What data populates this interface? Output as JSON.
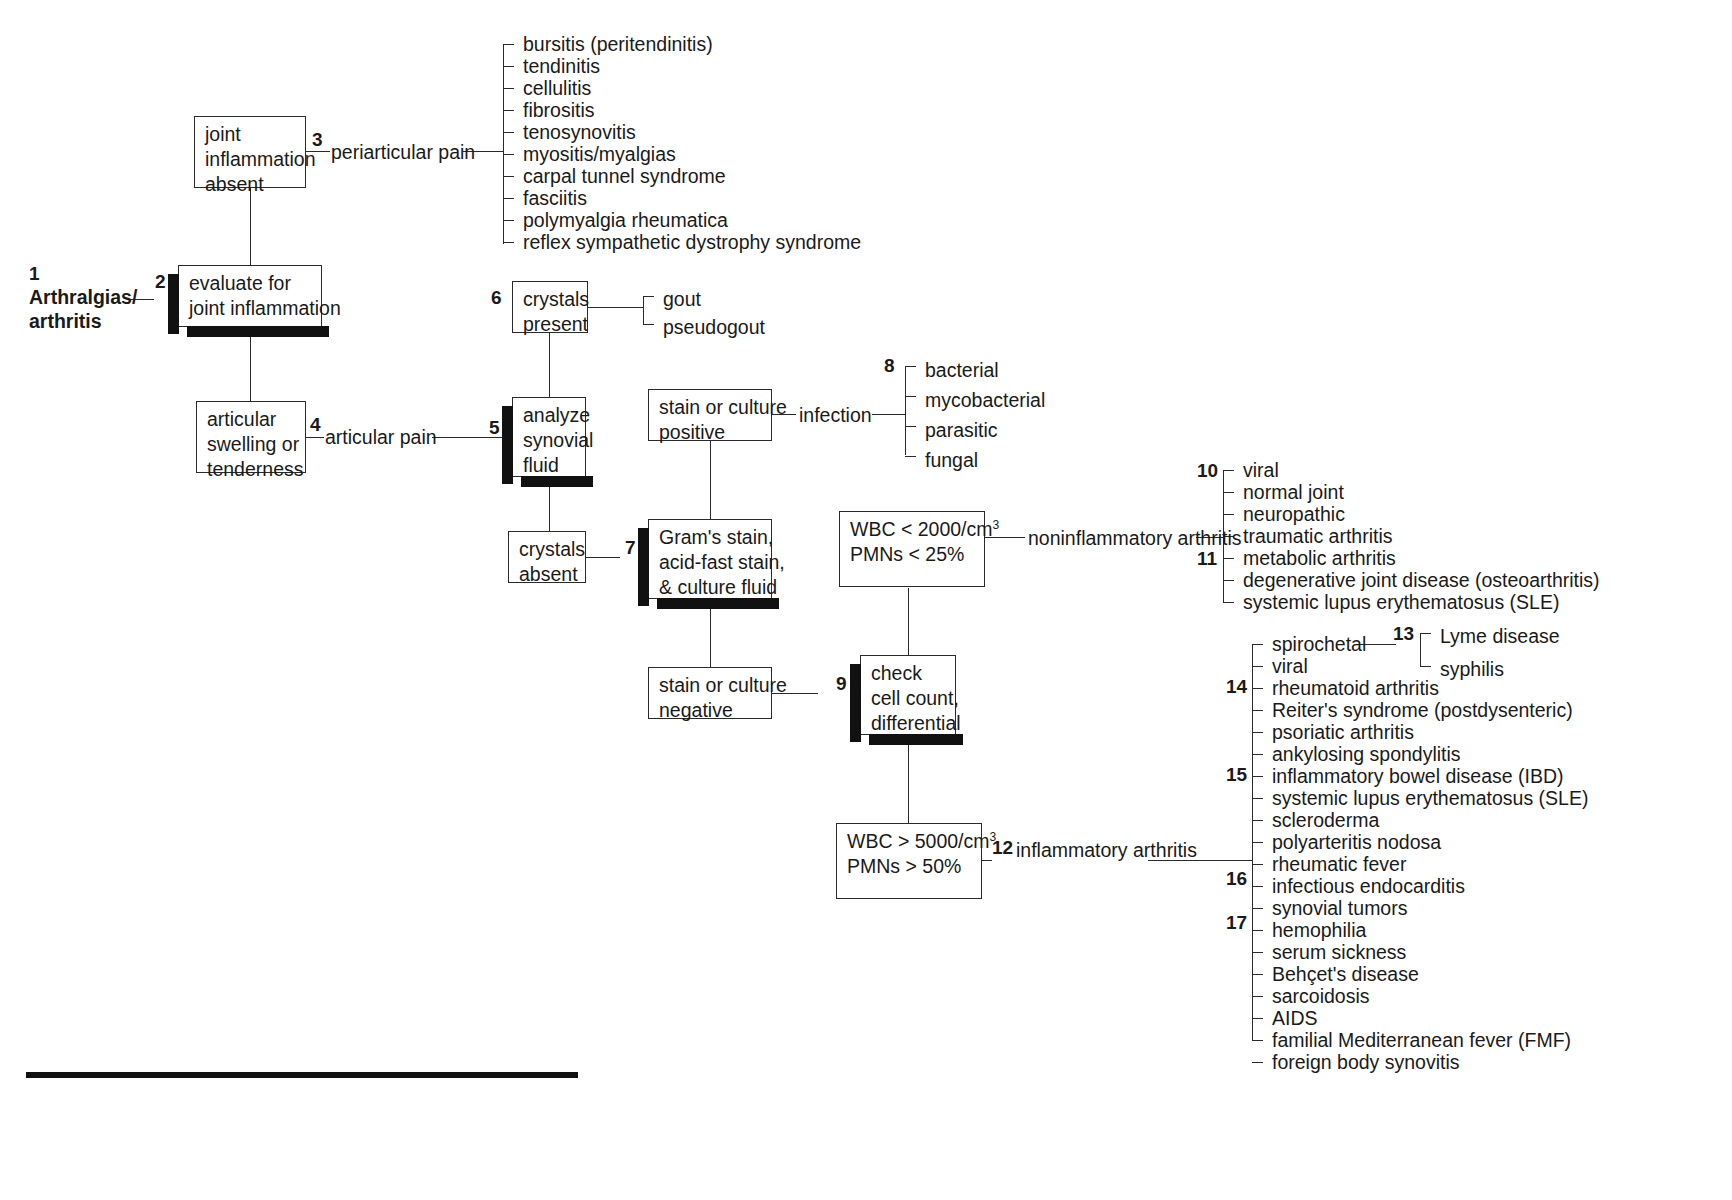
{
  "diagram": {
    "root": {
      "number": "1",
      "label_line1": "Arthralgias/",
      "label_line2": "arthritis"
    },
    "nodes": {
      "evaluate": {
        "number": "2",
        "line1": "evaluate for",
        "line2": "joint inflammation"
      },
      "joint_inflammation_absent": {
        "line1": "joint",
        "line2": "inflammation",
        "line3": "absent"
      },
      "articular_swelling": {
        "line1": "articular",
        "line2": "swelling or",
        "line3": "tenderness"
      },
      "analyze_synovial_fluid": {
        "number": "5",
        "line1": "analyze",
        "line2": "synovial",
        "line3": "fluid"
      },
      "crystals_present": {
        "number": "6",
        "line1": "crystals",
        "line2": "present"
      },
      "crystals_absent": {
        "line1": "crystals",
        "line2": "absent"
      },
      "grams_stain": {
        "number": "7",
        "line1": "Gram's stain,",
        "line2": "acid-fast stain,",
        "line3": "& culture fluid"
      },
      "stain_positive": {
        "line1": "stain or culture",
        "line2": "positive"
      },
      "stain_negative": {
        "line1": "stain or culture",
        "line2": "negative"
      },
      "check_cell_count": {
        "number": "9",
        "line1": "check",
        "line2": "cell count,",
        "line3": "differential"
      },
      "wbc_low": {
        "line1_pre": "WBC < 2000/cm",
        "line1_sup": "3",
        "line2": "PMNs < 25%"
      },
      "wbc_high": {
        "number": "12",
        "line1_pre": "WBC > 5000/cm",
        "line1_sup": "3",
        "line2": "PMNs > 50%"
      }
    },
    "edge_labels": {
      "periarticular_pain": {
        "number": "3",
        "text": "periarticular pain"
      },
      "articular_pain": {
        "number": "4",
        "text": "articular pain"
      },
      "infection": {
        "text": "infection"
      },
      "noninflammatory_arthritis": {
        "text": "noninflammatory arthritis"
      },
      "inflammatory_arthritis": {
        "text": "inflammatory arthritis"
      }
    },
    "lists": {
      "periarticular": [
        {
          "text": "bursitis (peritendinitis)"
        },
        {
          "text": "tendinitis"
        },
        {
          "text": "cellulitis"
        },
        {
          "text": "fibrositis"
        },
        {
          "text": "tenosynovitis"
        },
        {
          "text": "myositis/myalgias"
        },
        {
          "text": "carpal tunnel syndrome"
        },
        {
          "text": "fasciitis"
        },
        {
          "text": "polymyalgia rheumatica"
        },
        {
          "text": "reflex sympathetic dystrophy syndrome"
        }
      ],
      "crystals": [
        {
          "text": "gout"
        },
        {
          "text": "pseudogout"
        }
      ],
      "infection": [
        {
          "number": "8",
          "text": "bacterial"
        },
        {
          "text": "mycobacterial"
        },
        {
          "text": "parasitic"
        },
        {
          "text": "fungal"
        }
      ],
      "noninflammatory": [
        {
          "number": "10",
          "text": "viral"
        },
        {
          "text": "normal joint"
        },
        {
          "text": "neuropathic"
        },
        {
          "text": "traumatic arthritis"
        },
        {
          "number": "11",
          "text": "metabolic arthritis"
        },
        {
          "text": "degenerative joint disease (osteoarthritis)"
        },
        {
          "text": "systemic lupus erythematosus (SLE)"
        }
      ],
      "inflammatory": [
        {
          "text": "spirochetal"
        },
        {
          "text": "viral"
        },
        {
          "number": "14",
          "text": "rheumatoid arthritis"
        },
        {
          "text": "Reiter's syndrome (postdysenteric)"
        },
        {
          "text": "psoriatic arthritis"
        },
        {
          "text": "ankylosing spondylitis"
        },
        {
          "number": "15",
          "text": "inflammatory bowel disease (IBD)"
        },
        {
          "text": "systemic lupus erythematosus (SLE)"
        },
        {
          "text": "scleroderma"
        },
        {
          "text": "polyarteritis nodosa"
        },
        {
          "text": "rheumatic fever"
        },
        {
          "number": "16",
          "text": "infectious endocarditis"
        },
        {
          "text": "synovial tumors"
        },
        {
          "number": "17",
          "text": "hemophilia"
        },
        {
          "text": "serum sickness"
        },
        {
          "text": "Behçet's disease"
        },
        {
          "text": "sarcoidosis"
        },
        {
          "text": "AIDS"
        },
        {
          "text": "familial Mediterranean fever (FMF)"
        },
        {
          "text": "foreign body synovitis"
        }
      ],
      "spirochetal": [
        {
          "number": "13",
          "text": "Lyme disease"
        },
        {
          "text": "syphilis"
        }
      ]
    }
  }
}
